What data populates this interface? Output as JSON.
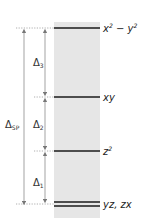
{
  "diagram": {
    "type": "energy-level-diagram",
    "colors": {
      "band": "#e6e6e6",
      "level_line": "#1a1a1a",
      "arrow": "#888888",
      "dotted": "#9a9a9a",
      "text": "#222222"
    },
    "levels": [
      {
        "label": "x² − y²",
        "base": "x",
        "sup1": "2",
        "mid": " − y",
        "sup2": "2",
        "y": 28,
        "double": false
      },
      {
        "label": "xy",
        "y": 97,
        "double": false
      },
      {
        "label": "z²",
        "base": "z",
        "sup1": "2",
        "y": 151,
        "double": false
      },
      {
        "label": "yz, zx",
        "y": 204,
        "double": true
      }
    ],
    "gaps": [
      {
        "symbol": "Δ",
        "sub": "3",
        "from": "xy",
        "to": "x² − y²"
      },
      {
        "symbol": "Δ",
        "sub": "2",
        "from": "z²",
        "to": "xy"
      },
      {
        "symbol": "Δ",
        "sub": "1",
        "from": "yz, zx",
        "to": "z²"
      }
    ],
    "total_gap": {
      "symbol": "Δ",
      "sub": "SP",
      "from": "yz, zx",
      "to": "x² − y²"
    }
  }
}
